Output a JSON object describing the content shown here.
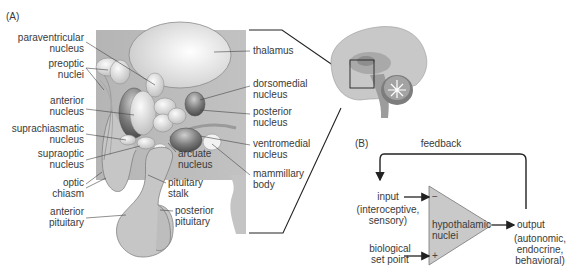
{
  "panel_a": {
    "label": "(A)",
    "left_labels": [
      {
        "line1": "paraventricular",
        "line2": "nucleus"
      },
      {
        "line1": "preoptic",
        "line2": "nuclei"
      },
      {
        "line1": "anterior",
        "line2": "nucleus"
      },
      {
        "line1": "suprachiasmatic",
        "line2": "nucleus"
      },
      {
        "line1": "supraoptic",
        "line2": "nucleus"
      },
      {
        "line1": "optic",
        "line2": "chiasm"
      },
      {
        "line1": "anterior",
        "line2": "pituitary"
      }
    ],
    "right_labels": [
      {
        "line1": "thalamus",
        "line2": ""
      },
      {
        "line1": "dorsomedial",
        "line2": "nucleus"
      },
      {
        "line1": "posterior",
        "line2": "nucleus"
      },
      {
        "line1": "ventromedial",
        "line2": "nucleus"
      },
      {
        "line1": "mammillary",
        "line2": "body"
      }
    ],
    "inner_labels": [
      {
        "line1": "arcuate",
        "line2": "nucleus"
      },
      {
        "line1": "pituitary",
        "line2": "stalk"
      },
      {
        "line1": "posterior",
        "line2": "pituitary"
      }
    ]
  },
  "panel_b": {
    "label": "(B)",
    "feedback": "feedback",
    "input": {
      "line1": "input",
      "line2": "(interoceptive,",
      "line3": "sensory)"
    },
    "set_point": {
      "line1": "biological",
      "line2": "set point"
    },
    "amplifier": {
      "line1": "hypothalamic",
      "line2": "nuclei",
      "minus": "−",
      "plus": "+"
    },
    "output": {
      "line1": "output",
      "line2": "(autonomic,",
      "line3": "endocrine,",
      "line4": "behavioral)"
    }
  },
  "colors": {
    "background_panel": "#b9b9b9",
    "tissue": "#c9c9c9",
    "thalamus": "#e6e6e6",
    "dark_nucleus": "#6e6e6e",
    "light_nucleus": "#e8e8e8",
    "amplifier_fill": "#c8c8c8",
    "line": "#333333"
  }
}
